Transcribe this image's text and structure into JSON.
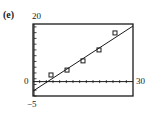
{
  "panel_label": "(e)",
  "axes": {
    "y_max_label": "20",
    "y_min_label": "−5",
    "x_min_label": "0",
    "x_max_label": "30"
  },
  "chart_data": {
    "type": "scatter",
    "title": "",
    "xlabel": "",
    "ylabel": "",
    "xlim": [
      0,
      30
    ],
    "ylim": [
      -5,
      20
    ],
    "x_tick_spacing": 2,
    "y_tick_spacing": 2,
    "grid": false,
    "legend": null,
    "series": [
      {
        "name": "data points",
        "marker": "square",
        "x": [
          5.4,
          10.2,
          15.0,
          19.8,
          24.6
        ],
        "y": [
          2.3,
          4.0,
          7.2,
          11.0,
          16.9
        ]
      },
      {
        "name": "regression line",
        "type": "line",
        "x": [
          0,
          30
        ],
        "y": [
          -3.3,
          19.3
        ]
      }
    ],
    "annotations": [
      "(e)"
    ]
  },
  "colors": {
    "ink": "#1a1a1a",
    "background": "#ffffff"
  }
}
